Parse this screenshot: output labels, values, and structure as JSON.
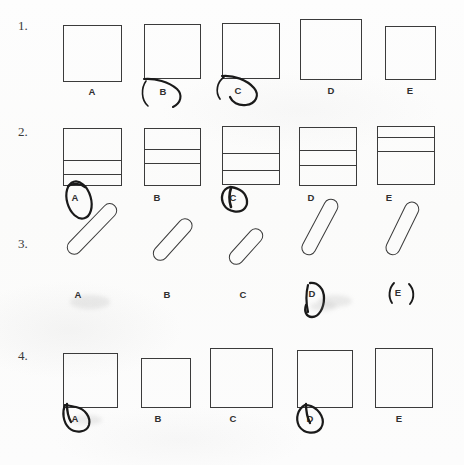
{
  "worksheet": {
    "background_color": "#fdfdfd",
    "ink_color": "#3b3b3b",
    "pen_color": "#1a1a1a",
    "questions": [
      {
        "number": "1.",
        "number_x": 18,
        "number_y": 18,
        "type": "plain-square",
        "options": [
          {
            "label": "A",
            "x": 63,
            "y": 25,
            "w": 59,
            "h": 57,
            "circled": false,
            "mark_style": "none"
          },
          {
            "label": "B",
            "x": 144,
            "y": 24,
            "w": 57,
            "h": 55,
            "circled": true,
            "mark_style": "arc-open"
          },
          {
            "label": "C",
            "x": 222,
            "y": 23,
            "w": 58,
            "h": 56,
            "circled": true,
            "mark_style": "arc-loop"
          },
          {
            "label": "D",
            "x": 300,
            "y": 19,
            "w": 62,
            "h": 61,
            "circled": false,
            "mark_style": "none"
          },
          {
            "label": "E",
            "x": 385,
            "y": 26,
            "w": 51,
            "h": 54,
            "circled": false,
            "mark_style": "none"
          }
        ]
      },
      {
        "number": "2.",
        "number_x": 18,
        "number_y": 124,
        "type": "divided-square",
        "options": [
          {
            "label": "A",
            "x": 63,
            "y": 128,
            "w": 59,
            "h": 58,
            "lines_pct": [
              55,
              80
            ],
            "circled": true,
            "mark_style": "ellipse-tall"
          },
          {
            "label": "B",
            "x": 144,
            "y": 128,
            "w": 57,
            "h": 58,
            "lines_pct": [
              35,
              60
            ],
            "circled": false,
            "mark_style": "none"
          },
          {
            "label": "C",
            "x": 222,
            "y": 126,
            "w": 58,
            "h": 59,
            "lines_pct": [
              45,
              75
            ],
            "circled": true,
            "mark_style": "ellipse-small"
          },
          {
            "label": "D",
            "x": 299,
            "y": 127,
            "w": 58,
            "h": 59,
            "lines_pct": [
              38,
              65
            ],
            "circled": false,
            "mark_style": "none"
          },
          {
            "label": "E",
            "x": 377,
            "y": 126,
            "w": 58,
            "h": 59,
            "lines_pct": [
              18,
              42
            ],
            "circled": false,
            "mark_style": "none"
          }
        ]
      },
      {
        "number": "3.",
        "number_x": 18,
        "number_y": 236,
        "type": "diagonal-capsule",
        "options": [
          {
            "label": "A",
            "x": 66,
            "y": 238,
            "len": 66,
            "thick": 15,
            "angle": -46,
            "circled": false,
            "mark_style": "none"
          },
          {
            "label": "B",
            "x": 152,
            "y": 244,
            "len": 52,
            "thick": 15,
            "angle": -48,
            "circled": false,
            "mark_style": "none"
          },
          {
            "label": "C",
            "x": 228,
            "y": 248,
            "len": 44,
            "thick": 15,
            "angle": -48,
            "circled": false,
            "mark_style": "none"
          },
          {
            "label": "D",
            "x": 300,
            "y": 238,
            "len": 62,
            "thick": 15,
            "angle": -62,
            "circled": true,
            "mark_style": "loop-tall"
          },
          {
            "label": "E",
            "x": 384,
            "y": 238,
            "len": 58,
            "thick": 15,
            "angle": -64,
            "circled": true,
            "mark_style": "paren"
          }
        ]
      },
      {
        "number": "4.",
        "number_x": 18,
        "number_y": 348,
        "type": "plain-square",
        "options": [
          {
            "label": "A",
            "x": 63,
            "y": 353,
            "w": 55,
            "h": 55,
            "circled": true,
            "mark_style": "teardrop-left"
          },
          {
            "label": "B",
            "x": 141,
            "y": 358,
            "w": 50,
            "h": 50,
            "circled": false,
            "mark_style": "none"
          },
          {
            "label": "C",
            "x": 210,
            "y": 348,
            "w": 63,
            "h": 60,
            "circled": false,
            "mark_style": "none"
          },
          {
            "label": "D",
            "x": 297,
            "y": 350,
            "w": 56,
            "h": 58,
            "circled": true,
            "mark_style": "teardrop-left"
          },
          {
            "label": "E",
            "x": 375,
            "y": 348,
            "w": 58,
            "h": 60,
            "circled": false,
            "mark_style": "none"
          }
        ]
      }
    ]
  }
}
